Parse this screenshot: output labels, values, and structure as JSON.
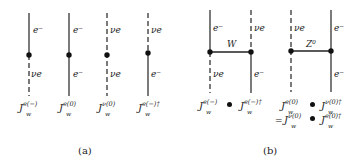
{
  "panel_a": {
    "caption": "(a)",
    "diagrams": [
      {
        "top": "e⁻",
        "bottom": "ν_e",
        "top_style": "solid",
        "bottom_style": "dashed",
        "current": "J",
        "sup": "e(−)",
        "sub": "w"
      },
      {
        "top": "e⁻",
        "bottom": "e⁻",
        "top_style": "solid",
        "bottom_style": "solid",
        "current": "J",
        "sup": "e(0)",
        "sub": "w"
      },
      {
        "top": "ν_e",
        "bottom": "ν_e",
        "top_style": "dashed",
        "bottom_style": "dashed",
        "current": "J",
        "sup": "ν(0)",
        "sub": "w"
      },
      {
        "top": "ν_e",
        "bottom": "e⁻",
        "top_style": "dashed",
        "bottom_style": "solid",
        "current": "J",
        "sup": "e(−)†",
        "sub": "w"
      }
    ],
    "labels": {
      "d1_top": "e⁻",
      "d1_bottom": "νe",
      "d2_top": "e⁻",
      "d2_bottom": "e⁻",
      "d3_top": "νe",
      "d3_bottom": "νe",
      "d4_top": "νe",
      "d4_bottom": "e⁻"
    },
    "currents": {
      "c1_sup": "e(−)",
      "c2_sup": "e(0)",
      "c3_sup": "ν(0)",
      "c4_sup": "e(−)†",
      "J": "J",
      "w": "w"
    }
  },
  "panel_b": {
    "caption": "(b)",
    "left": {
      "boson": "W",
      "labels": {
        "tl": "e⁻",
        "tr": "νe",
        "bl": "νe",
        "br": "e⁻"
      },
      "product": {
        "j1_sup": "e(−)",
        "j2_sup": "e(−)†"
      }
    },
    "right": {
      "boson": "Z⁰",
      "labels": {
        "tl": "νe",
        "tr": "e⁻",
        "br": "e⁻"
      },
      "product": {
        "j1_sup": "e(0)",
        "j2_sup": "ν(0)†"
      },
      "equals": "=",
      "product2": {
        "j1_sup": "ν(0)",
        "j2_sup": "e(0)†"
      }
    }
  }
}
